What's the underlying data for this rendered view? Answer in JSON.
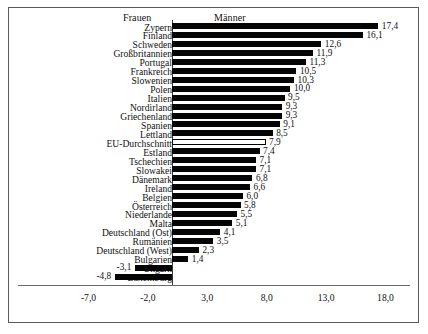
{
  "figure": {
    "background": "#ffffff",
    "frame_color": "#5b5b5b",
    "bar_color": "#050505",
    "highlight_bar_color": "#ffffff"
  },
  "headers": {
    "left_label": "Frauen",
    "right_label": "Männer"
  },
  "chart_data": {
    "type": "bar",
    "orientation": "horizontal",
    "title": "",
    "subtitle": "",
    "xlabel": "",
    "ylabel": "",
    "xlim": [
      -7.0,
      18.0
    ],
    "xticks": [
      "-7,0",
      "-2,0",
      "3,0",
      "8,0",
      "13,0",
      "18,0"
    ],
    "xtick_values": [
      -7.0,
      -2.0,
      3.0,
      8.0,
      13.0,
      18.0
    ],
    "grid": false,
    "legend": [
      "Frauen",
      "Männer"
    ],
    "legend_position": "top",
    "decimal_separator": ",",
    "categories": [
      "Zypern",
      "Finland",
      "Schweden",
      "Großbritannien",
      "Portugal",
      "Frankreich",
      "Slowenien",
      "Polen",
      "Italien",
      "Nordirland",
      "Griechenland",
      "Spanien",
      "Lettland",
      "EU-Durchschnitt",
      "Estland",
      "Tschechien",
      "Slowakei",
      "Dänemark",
      "Ireland",
      "Belgien",
      "Österreich",
      "Niederlande",
      "Malta",
      "Deutschland (Ost)",
      "Rumänien",
      "Deutschland (West)",
      "Bulgarien",
      "Ungarn",
      "Luxemburg"
    ],
    "values": [
      17.4,
      16.1,
      12.6,
      11.9,
      11.3,
      10.5,
      10.3,
      10.0,
      9.5,
      9.3,
      9.3,
      9.1,
      8.5,
      7.9,
      7.4,
      7.1,
      7.1,
      6.8,
      6.6,
      6.0,
      5.8,
      5.5,
      5.1,
      4.1,
      3.5,
      2.3,
      1.4,
      -3.1,
      -4.8
    ],
    "value_labels": [
      "17,4",
      "16,1",
      "12,6",
      "11,9",
      "11,3",
      "10,5",
      "10,3",
      "10,0",
      "9,5",
      "9,3",
      "9,3",
      "9,1",
      "8,5",
      "7,9",
      "7,4",
      "7,1",
      "7,1",
      "6,8",
      "6,6",
      "6,0",
      "5,8",
      "5,5",
      "5,1",
      "4,1",
      "3,5",
      "2,3",
      "1,4",
      "-3,1",
      "-4,8"
    ],
    "highlighted_category": "EU-Durchschnitt"
  }
}
